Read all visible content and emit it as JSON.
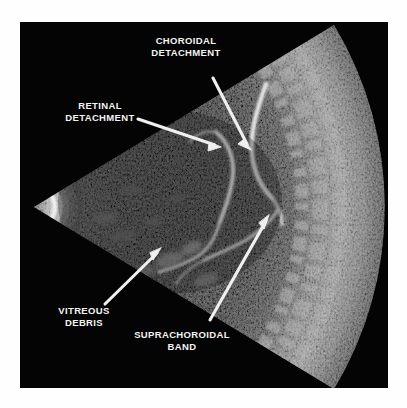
{
  "figure": {
    "kind": "ocular-b-scan-ultrasound",
    "background_color": "#ffffff",
    "panel_color": "#040404",
    "annotation_color": "#f4f4f4"
  },
  "annotations": [
    {
      "id": "choroidal-detachment",
      "label": "CHOROIDAL\nDETACHMENT",
      "arrow": {
        "x1": 193,
        "y1": 56,
        "x2": 231,
        "y2": 128
      }
    },
    {
      "id": "retinal-detachment",
      "label": "RETINAL\nDETACHMENT",
      "arrow": {
        "x1": 118,
        "y1": 97,
        "x2": 201,
        "y2": 125
      }
    },
    {
      "id": "vitreous-debris",
      "label": "VITREOUS\nDEBRIS",
      "arrow": {
        "x1": 85,
        "y1": 282,
        "x2": 141,
        "y2": 226
      }
    },
    {
      "id": "suprachoroidal-band",
      "label": "SUPRACHOROIDAL\nBAND",
      "arrow": {
        "x1": 190,
        "y1": 298,
        "x2": 249,
        "y2": 193
      }
    }
  ],
  "scan_geometry": {
    "apex_x": 12,
    "apex_y": 185,
    "near_radius": 20,
    "far_radius": 352,
    "half_angle_deg": 31
  }
}
